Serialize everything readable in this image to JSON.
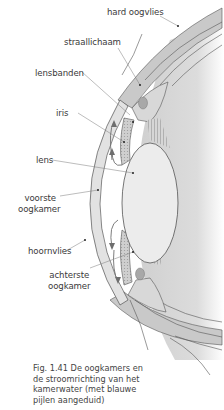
{
  "figure": {
    "labels": {
      "hard_oogvlies": "hard oogvlies",
      "straallichaam": "straallichaam",
      "lensbanden": "lensbanden",
      "iris": "iris",
      "lens": "lens",
      "voorste_oogkamer_1": "voorste",
      "voorste_oogkamer_2": "oogkamer",
      "hoornvlies": "hoornvlies",
      "achterste_oogkamer_1": "achterste",
      "achterste_oogkamer_2": "oogkamer"
    },
    "caption": {
      "line1": "Fig. 1.41  De oogkamers en",
      "line2": "de stroomrichting van het",
      "line3": "kamerwater (met blauwe",
      "line4": "pijlen aangeduid)"
    },
    "colors": {
      "sclera": "#c9c9c9",
      "outline": "#555555",
      "lens_fill": "#ececec",
      "shading": "#d8d8d8",
      "label_text": "#3a3a3a",
      "arrows": "#6e6e6e"
    }
  }
}
